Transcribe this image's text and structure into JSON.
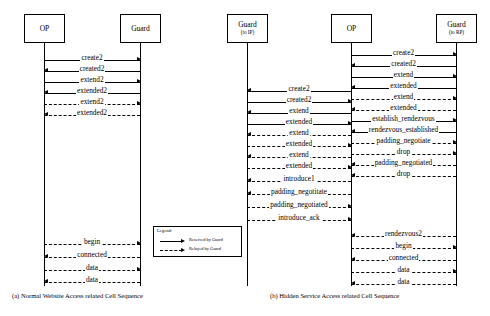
{
  "figure": {
    "type": "uml-sequence-diagram",
    "panels": [
      {
        "id": "panel-a",
        "caption": "(a) Normal Website Access related Cell Sequence",
        "lifelines": [
          {
            "id": "op",
            "label": "OP",
            "sublabel": ""
          },
          {
            "id": "guard",
            "label": "Guard",
            "sublabel": ""
          }
        ],
        "messages": [
          {
            "label": "create2",
            "from": "op",
            "to": "guard",
            "dir": "right",
            "style": "solid"
          },
          {
            "label": "created2",
            "from": "guard",
            "to": "op",
            "dir": "left",
            "style": "solid"
          },
          {
            "label": "extend2",
            "from": "op",
            "to": "guard",
            "dir": "right",
            "style": "solid"
          },
          {
            "label": "extended2",
            "from": "guard",
            "to": "op",
            "dir": "left",
            "style": "solid"
          },
          {
            "label": "extend2",
            "from": "op",
            "to": "guard",
            "dir": "right",
            "style": "dashed"
          },
          {
            "label": "extended2",
            "from": "guard",
            "to": "op",
            "dir": "left",
            "style": "dashed"
          },
          {
            "label": "begin",
            "from": "op",
            "to": "guard",
            "dir": "right",
            "style": "dashed"
          },
          {
            "label": "connected",
            "from": "guard",
            "to": "op",
            "dir": "left",
            "style": "dashed"
          },
          {
            "label": "data",
            "from": "op",
            "to": "guard",
            "dir": "right",
            "style": "dashed"
          },
          {
            "label": "data",
            "from": "guard",
            "to": "op",
            "dir": "left",
            "style": "dashed"
          }
        ]
      },
      {
        "id": "panel-b",
        "caption": "(b) Hidden Service Access related Cell Sequence",
        "lifelines": [
          {
            "id": "guard-ip",
            "label": "Guard",
            "sublabel": "(to IP)"
          },
          {
            "id": "op2",
            "label": "OP",
            "sublabel": ""
          },
          {
            "id": "guard-rp",
            "label": "Guard",
            "sublabel": "(to RP)"
          }
        ],
        "messages_left": [
          {
            "label": "create2",
            "dir": "left",
            "style": "solid"
          },
          {
            "label": "created2",
            "dir": "right",
            "style": "solid"
          },
          {
            "label": "extend",
            "dir": "left",
            "style": "solid"
          },
          {
            "label": "extended",
            "dir": "right",
            "style": "solid"
          },
          {
            "label": "extend",
            "dir": "left",
            "style": "dashed"
          },
          {
            "label": "extended",
            "dir": "right",
            "style": "dashed"
          },
          {
            "label": "extend",
            "dir": "left",
            "style": "dashed"
          },
          {
            "label": "extended",
            "dir": "right",
            "style": "dashed"
          },
          {
            "label": "introduce1",
            "dir": "left",
            "style": "dashed"
          },
          {
            "label": "padding_negotitate",
            "dir": "left",
            "style": "dashed"
          },
          {
            "label": "padding_negotiated",
            "dir": "right",
            "style": "dashed"
          },
          {
            "label": "introduce_ack",
            "dir": "right",
            "style": "dashed"
          }
        ],
        "messages_right": [
          {
            "label": "create2",
            "dir": "right",
            "style": "solid"
          },
          {
            "label": "created2",
            "dir": "left",
            "style": "solid"
          },
          {
            "label": "extend",
            "dir": "right",
            "style": "solid"
          },
          {
            "label": "extended",
            "dir": "left",
            "style": "solid"
          },
          {
            "label": "extend",
            "dir": "right",
            "style": "dashed"
          },
          {
            "label": "extended",
            "dir": "left",
            "style": "dashed"
          },
          {
            "label": "establish_rendezvous",
            "dir": "right",
            "style": "solid"
          },
          {
            "label": "rendezvous_established",
            "dir": "left",
            "style": "solid"
          },
          {
            "label": "padding_negotiate",
            "dir": "right",
            "style": "dashed"
          },
          {
            "label": "drop",
            "dir": "right",
            "style": "dashed"
          },
          {
            "label": "padding_negotiated",
            "dir": "left",
            "style": "dashed"
          },
          {
            "label": "drop",
            "dir": "left",
            "style": "dashed"
          },
          {
            "label": "rendezvous2",
            "dir": "left",
            "style": "dashed"
          },
          {
            "label": "begin",
            "dir": "right",
            "style": "dashed"
          },
          {
            "label": "connected",
            "dir": "left",
            "style": "dashed"
          },
          {
            "label": "data",
            "dir": "right",
            "style": "dashed"
          },
          {
            "label": "data",
            "dir": "left",
            "style": "dashed"
          }
        ]
      }
    ],
    "legend": {
      "title": "Legend:",
      "entries": [
        {
          "label": "Received by Guard",
          "style": "solid"
        },
        {
          "label": "Relayed by Guard",
          "style": "dashed"
        }
      ]
    }
  }
}
